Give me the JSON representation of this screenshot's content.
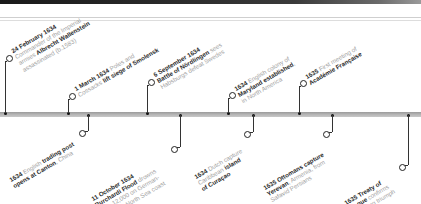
{
  "timeline": {
    "events_above": [
      {
        "id": "wallenstein",
        "lines": [
          [
            {
              "t": "24 February 1634",
              "b": true
            }
          ],
          [
            {
              "t": "Commander of the Imperial",
              "b": false
            }
          ],
          [
            {
              "t": "armies ",
              "b": false
            },
            {
              "t": "Albrecht Wallenstein",
              "b": true
            }
          ],
          [
            {
              "t": "assassinated (b.1583)",
              "b": false
            }
          ]
        ]
      },
      {
        "id": "smolensk",
        "lines": [
          [
            {
              "t": "1 March 1634 ",
              "b": true
            },
            {
              "t": "Poles and",
              "b": false
            }
          ],
          [
            {
              "t": "Cossacks ",
              "b": false
            },
            {
              "t": "lift siege of Smolensk",
              "b": true
            }
          ]
        ]
      },
      {
        "id": "nordlingen",
        "lines": [
          [
            {
              "t": "6 September 1634",
              "b": true
            }
          ],
          [
            {
              "t": "Battle of Nördlingen ",
              "b": true
            },
            {
              "t": "sees",
              "b": false
            }
          ],
          [
            {
              "t": "Habsburgs defeat Swedes",
              "b": false
            }
          ]
        ]
      },
      {
        "id": "maryland",
        "lines": [
          [
            {
              "t": "1634 ",
              "b": true
            },
            {
              "t": "English colony of",
              "b": false
            }
          ],
          [
            {
              "t": "Maryland established",
              "b": true
            },
            {
              "t": ",",
              "b": false
            }
          ],
          [
            {
              "t": "in North America",
              "b": false
            }
          ]
        ]
      },
      {
        "id": "academie",
        "lines": [
          [
            {
              "t": "1635 ",
              "b": true
            },
            {
              "t": "First meeting of",
              "b": false
            }
          ],
          [
            {
              "t": "Académie Française",
              "b": true
            }
          ]
        ]
      }
    ],
    "events_below": [
      {
        "id": "canton",
        "lines": [
          [
            {
              "t": "1634 ",
              "b": true
            },
            {
              "t": "English ",
              "b": false
            },
            {
              "t": "trading post",
              "b": true
            }
          ],
          [
            {
              "t": "opens at Canton",
              "b": true
            },
            {
              "t": ", China",
              "b": false
            }
          ]
        ]
      },
      {
        "id": "burchardi",
        "lines": [
          [
            {
              "t": "11 October 1634",
              "b": true
            }
          ],
          [
            {
              "t": "Burchardi Flood ",
              "b": true
            },
            {
              "t": "drowns",
              "b": false
            }
          ],
          [
            {
              "t": "up to 12,000 on German-",
              "b": false
            }
          ],
          [
            {
              "t": "Denmark North Sea coast",
              "b": false
            }
          ]
        ]
      },
      {
        "id": "curacao",
        "lines": [
          [
            {
              "t": "1634 ",
              "b": true
            },
            {
              "t": "Dutch capture",
              "b": false
            }
          ],
          [
            {
              "t": "Caribbean ",
              "b": false
            },
            {
              "t": "island",
              "b": true
            }
          ],
          [
            {
              "t": "of Curaçao",
              "b": true
            }
          ]
        ]
      },
      {
        "id": "yerevan",
        "lines": [
          [
            {
              "t": "1635 ",
              "b": true
            },
            {
              "t": "Ottomans capture",
              "b": true
            }
          ],
          [
            {
              "t": "Yerevan",
              "b": true
            },
            {
              "t": ", Armenia, from",
              "b": false
            }
          ],
          [
            {
              "t": "Safavid Persians",
              "b": false
            }
          ]
        ]
      },
      {
        "id": "prague",
        "lines": [
          [
            {
              "t": "1635 Treaty of",
              "b": true
            }
          ],
          [
            {
              "t": "Prague ",
              "b": true
            },
            {
              "t": "confirms",
              "b": false
            }
          ],
          [
            {
              "t": "Habsburg triumph",
              "b": false
            }
          ],
          [
            {
              "t": "in Germany",
              "b": false
            }
          ]
        ]
      }
    ]
  },
  "colors": {
    "axis": "#b0b0b0",
    "connector": "#333333",
    "bold_text": "#2a2a2a",
    "light_text": "#a0a0a0"
  }
}
